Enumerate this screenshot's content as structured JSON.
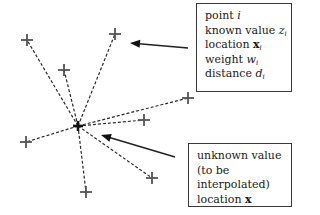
{
  "diagram": {
    "colors": {
      "line": "#2a2a2a",
      "marker": "#555555",
      "background": "#ffffff"
    },
    "unknown_point": {
      "x": 78,
      "y": 126,
      "label": "unknown location x"
    },
    "known_points": [
      {
        "x": 27,
        "y": 40
      },
      {
        "x": 64,
        "y": 70
      },
      {
        "x": 115,
        "y": 34
      },
      {
        "x": 188,
        "y": 98
      },
      {
        "x": 144,
        "y": 120
      },
      {
        "x": 26,
        "y": 142
      },
      {
        "x": 86,
        "y": 192
      },
      {
        "x": 152,
        "y": 178
      }
    ],
    "arrows": [
      {
        "name": "known-point-arrow",
        "from": [
          188,
          48
        ],
        "to": [
          130,
          43
        ]
      },
      {
        "name": "unknown-point-arrow",
        "from": [
          175,
          157
        ],
        "to": [
          101,
          135
        ]
      }
    ],
    "known_box": {
      "lines": [
        {
          "text": "point ",
          "var": "i",
          "sub": ""
        },
        {
          "text": "known value ",
          "var": "z",
          "sub": "i"
        },
        {
          "text": "location ",
          "bold": "x",
          "sub": "i"
        },
        {
          "text": "weight ",
          "var": "w",
          "sub": "i"
        },
        {
          "text": "distance ",
          "var": "d",
          "sub": "i"
        }
      ]
    },
    "unknown_box": {
      "lines": [
        {
          "text": "unknown value"
        },
        {
          "text": "(to be"
        },
        {
          "text": "interpolated)"
        },
        {
          "text": "location ",
          "bold": "x"
        }
      ]
    }
  }
}
